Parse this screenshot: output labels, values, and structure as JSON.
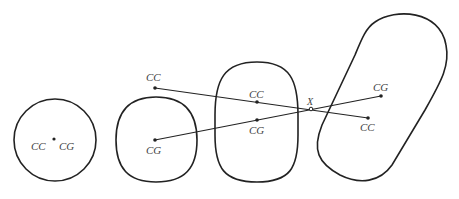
{
  "diagram": {
    "shapes": [
      {
        "id": "circle",
        "labels": [
          "CC",
          "CG"
        ]
      },
      {
        "id": "bulging-shape",
        "labels": [
          "CG"
        ]
      },
      {
        "id": "rounded-oval",
        "labels": [
          "CC",
          "CG"
        ]
      },
      {
        "id": "tilted-oval",
        "labels": [
          "CG",
          "CC"
        ]
      }
    ],
    "labels": {
      "s1_cc": "CC",
      "s1_cg": "CG",
      "line_cc_start": "CC",
      "s2_cg": "CG",
      "s3_cc": "CC",
      "s3_cg": "CG",
      "s4_cg": "CG",
      "s4_cc": "CC",
      "intersection": "X"
    },
    "stroke_color": "#222222",
    "label_color": "#444444"
  }
}
